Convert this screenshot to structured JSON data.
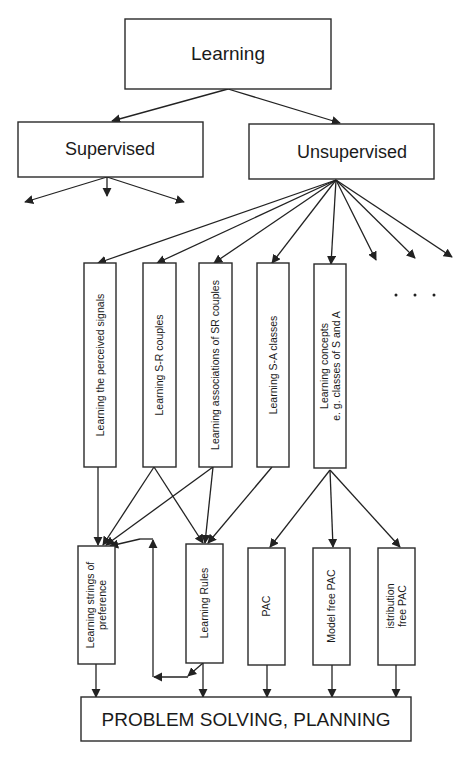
{
  "diagram": {
    "root": {
      "label": "Learning"
    },
    "level1": [
      {
        "id": "supervised",
        "label": "Supervised"
      },
      {
        "id": "unsupervised",
        "label": "Unsupervised"
      }
    ],
    "unsupervised_children": [
      {
        "id": "perceived-signals",
        "lines": [
          "Learning the perceived signals"
        ]
      },
      {
        "id": "sr-couples",
        "lines": [
          "Learning S-R couples"
        ]
      },
      {
        "id": "sr-associations",
        "lines": [
          "Learning associations of SR couples"
        ]
      },
      {
        "id": "sa-classes",
        "lines": [
          "Learning S-A classes"
        ]
      },
      {
        "id": "concepts",
        "lines": [
          "Learning concepts",
          "e. g. classes of S and A"
        ]
      }
    ],
    "ellipsis": ". . .",
    "level3": [
      {
        "id": "strings-preference",
        "lines": [
          "Learning strings of",
          "preference"
        ]
      },
      {
        "id": "rules",
        "lines": [
          "Learning Rules"
        ]
      },
      {
        "id": "pac",
        "lines": [
          "PAC"
        ]
      },
      {
        "id": "model-free-pac",
        "lines": [
          "Model free PAC"
        ]
      },
      {
        "id": "distribution-free-pac",
        "lines": [
          "istribution",
          "free PAC"
        ]
      }
    ],
    "sink": {
      "label": "PROBLEM SOLVING, PLANNING"
    },
    "edges": [
      [
        "Learning",
        "Supervised"
      ],
      [
        "Learning",
        "Unsupervised"
      ],
      [
        "Supervised",
        "(unlabeled) x3"
      ],
      [
        "Unsupervised",
        "Learning the perceived signals"
      ],
      [
        "Unsupervised",
        "Learning S-R couples"
      ],
      [
        "Unsupervised",
        "Learning associations of SR couples"
      ],
      [
        "Unsupervised",
        "Learning S-A classes"
      ],
      [
        "Unsupervised",
        "Learning concepts e. g. classes of S and A"
      ],
      [
        "Unsupervised",
        "(unlabeled) x3"
      ],
      [
        "Learning the perceived signals",
        "Learning strings of preference"
      ],
      [
        "Learning S-R couples",
        "Learning strings of preference"
      ],
      [
        "Learning S-R couples",
        "Learning Rules"
      ],
      [
        "Learning associations of SR couples",
        "Learning strings of preference"
      ],
      [
        "Learning associations of SR couples",
        "Learning Rules"
      ],
      [
        "Learning S-A classes",
        "Learning Rules"
      ],
      [
        "Learning Rules",
        "Learning strings of preference"
      ],
      [
        "Learning concepts e. g. classes of S and A",
        "PAC"
      ],
      [
        "Learning concepts e. g. classes of S and A",
        "Model free PAC"
      ],
      [
        "Learning concepts e. g. classes of S and A",
        "istribution free PAC"
      ],
      [
        "Learning strings of preference",
        "PROBLEM SOLVING, PLANNING"
      ],
      [
        "Learning Rules",
        "PROBLEM SOLVING, PLANNING"
      ],
      [
        "PAC",
        "PROBLEM SOLVING, PLANNING"
      ],
      [
        "Model free PAC",
        "PROBLEM SOLVING, PLANNING"
      ],
      [
        "istribution free PAC",
        "PROBLEM SOLVING, PLANNING"
      ]
    ]
  }
}
